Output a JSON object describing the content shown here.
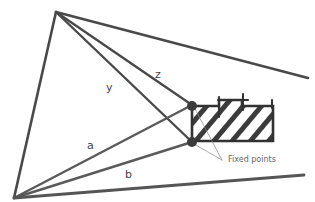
{
  "diagram": {
    "labels": {
      "y": "y",
      "z": "z",
      "a": "a",
      "b": "b",
      "fixed_points": "Fixed points"
    },
    "stroke_color": "#4a4a4a",
    "hatch_color": "#3a3a3a",
    "point_color": "#3c3c3c"
  }
}
